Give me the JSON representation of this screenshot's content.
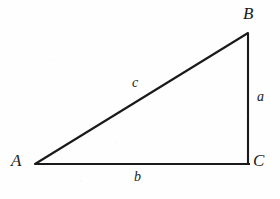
{
  "figure": {
    "name": "right-triangle-abc",
    "background_color": "#fefefe",
    "stroke_color": "#1a1a1a",
    "stroke_width": 2.1,
    "width": 280,
    "height": 199
  },
  "vertices": {
    "A": {
      "label": "A",
      "x": 35,
      "y": 164
    },
    "B": {
      "label": "B",
      "x": 248,
      "y": 33
    },
    "C": {
      "label": "C",
      "x": 248,
      "y": 164
    }
  },
  "sides": {
    "a": {
      "label": "a",
      "from": "B",
      "to": "C"
    },
    "b": {
      "label": "b",
      "from": "A",
      "to": "C"
    },
    "c": {
      "label": "c",
      "from": "A",
      "to": "B"
    }
  },
  "geometry": {
    "hypotenuse_path": "M 35 164 L 248 33",
    "vertical_leg_path": "M 248 33 L 248 164",
    "horizontal_leg_path": "M 35 164 L 250 164"
  }
}
